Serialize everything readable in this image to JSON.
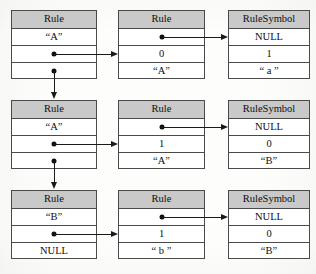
{
  "diagram": {
    "colors": {
      "header_fill": "#c9c9c9",
      "cell_fill": "#ffffff",
      "border": "#4a4a4a",
      "connector": "#1a1a1a",
      "page": "#fdfdfc"
    },
    "nodes": [
      {
        "id": "rule-a1",
        "type": "Rule",
        "header": "Rule",
        "cells": [
          {
            "kind": "text",
            "value": "“A”"
          },
          {
            "kind": "pointer",
            "value": ""
          },
          {
            "kind": "pointer",
            "value": ""
          }
        ]
      },
      {
        "id": "rule-a1-body",
        "type": "Rule",
        "header": "Rule",
        "cells": [
          {
            "kind": "pointer",
            "value": ""
          },
          {
            "kind": "text",
            "value": "0"
          },
          {
            "kind": "text",
            "value": "“A”"
          }
        ]
      },
      {
        "id": "rulesymbol-a",
        "type": "RuleSymbol",
        "header": "RuleSymbol",
        "cells": [
          {
            "kind": "text",
            "value": "NULL"
          },
          {
            "kind": "text",
            "value": "1"
          },
          {
            "kind": "text",
            "value": "“ a ”"
          }
        ]
      },
      {
        "id": "rule-a2",
        "type": "Rule",
        "header": "Rule",
        "cells": [
          {
            "kind": "text",
            "value": "“A”"
          },
          {
            "kind": "pointer",
            "value": ""
          },
          {
            "kind": "pointer",
            "value": ""
          }
        ]
      },
      {
        "id": "rule-a2-body",
        "type": "Rule",
        "header": "Rule",
        "cells": [
          {
            "kind": "pointer",
            "value": ""
          },
          {
            "kind": "text",
            "value": "1"
          },
          {
            "kind": "text",
            "value": "“A”"
          }
        ]
      },
      {
        "id": "rulesymbol-b1",
        "type": "RuleSymbol",
        "header": "RuleSymbol",
        "cells": [
          {
            "kind": "text",
            "value": "NULL"
          },
          {
            "kind": "text",
            "value": "0"
          },
          {
            "kind": "text",
            "value": "“B”"
          }
        ]
      },
      {
        "id": "rule-b",
        "type": "Rule",
        "header": "Rule",
        "cells": [
          {
            "kind": "text",
            "value": "“B”"
          },
          {
            "kind": "pointer",
            "value": ""
          },
          {
            "kind": "text",
            "value": "NULL"
          }
        ]
      },
      {
        "id": "rule-b-body",
        "type": "Rule",
        "header": "Rule",
        "cells": [
          {
            "kind": "pointer",
            "value": ""
          },
          {
            "kind": "text",
            "value": "1"
          },
          {
            "kind": "text",
            "value": "“ b ”"
          }
        ]
      },
      {
        "id": "rulesymbol-b2",
        "type": "RuleSymbol",
        "header": "RuleSymbol",
        "cells": [
          {
            "kind": "text",
            "value": "NULL"
          },
          {
            "kind": "text",
            "value": "0"
          },
          {
            "kind": "text",
            "value": "“B”"
          }
        ]
      }
    ]
  }
}
